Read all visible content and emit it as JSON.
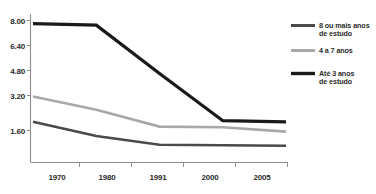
{
  "chart_data": {
    "type": "line",
    "title": "",
    "subtitle": "",
    "xlabel": "",
    "ylabel": "",
    "x": [
      "1970",
      "1980",
      "1991",
      "2000",
      "2005"
    ],
    "categories": [
      "1970",
      "1980",
      "1991",
      "2000",
      "2005"
    ],
    "xtick_labels": [
      "1970",
      "1980",
      "1991",
      "2000",
      "2005"
    ],
    "ytick_labels": [
      "8.00",
      "6.40",
      "4.80",
      "3.20",
      "1.60"
    ],
    "ytick_values": [
      8.0,
      6.4,
      4.8,
      3.2,
      1.6
    ],
    "ylim": [
      0.4,
      8.2
    ],
    "grid": false,
    "legend_position": "right",
    "series": [
      {
        "name": "Até 3 anos de estudo",
        "legend_label_line1": "Até 3 anos",
        "legend_label_line2": "de estudo",
        "color": "#1a1a1a",
        "linewidth": 3.2,
        "values": [
          7.8,
          7.7,
          4.6,
          2.05,
          2.0
        ]
      },
      {
        "name": "4 a 7 anos",
        "legend_label_line1": "4 a 7 anos",
        "legend_label_line2": "",
        "color": "#a8a8a8",
        "linewidth": 2.6,
        "values": [
          3.15,
          2.55,
          1.78,
          1.75,
          1.55
        ]
      },
      {
        "name": "8 ou mais anos de estudo",
        "legend_label_line1": "8 ou mais anos",
        "legend_label_line2": "de estudo",
        "color": "#4a4a4a",
        "linewidth": 2.6,
        "values": [
          2.0,
          1.35,
          0.95,
          0.93,
          0.9
        ]
      }
    ]
  },
  "legend": {
    "entries": [
      {
        "label_line1": "8 ou mais anos",
        "label_line2": "de estudo",
        "color": "#4a4a4a"
      },
      {
        "label_line1": "4 a 7 anos",
        "label_line2": "",
        "color": "#a8a8a8"
      },
      {
        "label_line1": "Até 3 anos",
        "label_line2": "de estudo",
        "color": "#1a1a1a"
      }
    ]
  },
  "axes": {
    "y_labels": [
      "8.00",
      "6.40",
      "4.80",
      "3.20",
      "1.60"
    ],
    "x_labels": [
      "1970",
      "1980",
      "1991",
      "2000",
      "2005"
    ]
  },
  "colors": {
    "background": "#ffffff",
    "axis": "#8d8d8d",
    "text": "#2b2b2b",
    "series_dark_gray": "#4a4a4a",
    "series_light_gray": "#a8a8a8",
    "series_black": "#1a1a1a"
  }
}
